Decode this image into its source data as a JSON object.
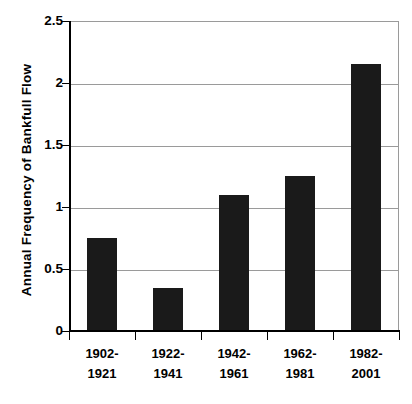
{
  "chart_data": {
    "type": "bar",
    "title": "",
    "xlabel": "",
    "ylabel": "Annual Frequency of Bankfull Flow",
    "categories": [
      "1902-1921",
      "1922-1941",
      "1942-1961",
      "1962-1981",
      "1982-2001"
    ],
    "category_lines": [
      [
        "1902-",
        "1921"
      ],
      [
        "1922-",
        "1941"
      ],
      [
        "1942-",
        "1961"
      ],
      [
        "1962-",
        "1981"
      ],
      [
        "1982-",
        "2001"
      ]
    ],
    "values": [
      0.75,
      0.35,
      1.1,
      1.25,
      2.15
    ],
    "ylim": [
      0,
      2.5
    ],
    "ytick_values": [
      0,
      0.5,
      1,
      1.5,
      2,
      2.5
    ],
    "ytick_labels": [
      "0",
      "0.5",
      "1",
      "1.5",
      "2",
      "2.5"
    ],
    "grid": "horizontal",
    "legend": "none",
    "bar_color": "#1a1a1a",
    "gridline_color": "#9a9a9a",
    "axis_color": "#000000",
    "background_color": "#ffffff"
  }
}
